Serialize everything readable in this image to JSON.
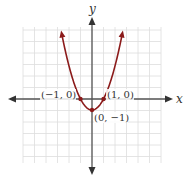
{
  "header": {
    "cropped_text": ""
  },
  "axes": {
    "x_label": "x",
    "y_label": "y"
  },
  "points": [
    {
      "label": "(−1, 0)",
      "x": -1,
      "y": 0
    },
    {
      "label": "(1, 0)",
      "x": 1,
      "y": 0
    },
    {
      "label": "(0, −1)",
      "x": 0,
      "y": -1
    }
  ],
  "colors": {
    "curve": "#8b1a1a",
    "axis": "#555555",
    "grid": "#dddddd"
  },
  "chart_data": {
    "type": "line",
    "title": "",
    "function": "",
    "xlabel": "x",
    "ylabel": "y",
    "xlim": [
      -6,
      6
    ],
    "ylim": [
      -5.5,
      6.3
    ],
    "grid": true,
    "x": [
      -2.65,
      -2,
      -1,
      0,
      1,
      2,
      2.65
    ],
    "series": [
      {
        "name": "parabola",
        "values": [
          6.02,
          3,
          0,
          -1,
          0,
          3,
          6.02
        ]
      }
    ],
    "annotations": [
      "(−1, 0)",
      "(1, 0)",
      "(0, −1)"
    ]
  }
}
